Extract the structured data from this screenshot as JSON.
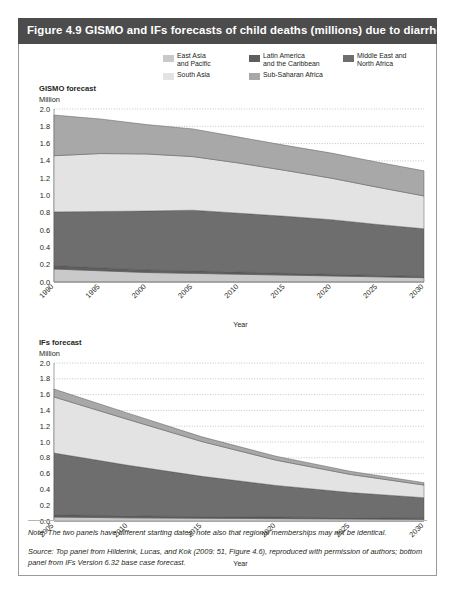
{
  "figure": {
    "title": "Figure 4.9 GISMO and IFs forecasts of child deaths (millions) due to diarrhea",
    "title_bar_color": "#4c4c4c"
  },
  "legend": {
    "items": [
      {
        "label_line1": "East Asia",
        "label_line2": "and Pacific",
        "color": "#c9c9c9",
        "name": "east-asia-and-pacific"
      },
      {
        "label_line1": "Latin America",
        "label_line2": "and the Caribbean",
        "color": "#5e5e5e",
        "name": "latin-america-and-the-caribbean"
      },
      {
        "label_line1": "Middle East and",
        "label_line2": "North Africa",
        "color": "#6e6e6e",
        "name": "middle-east-and-north-africa"
      },
      {
        "label_line1": "South Asia",
        "label_line2": "",
        "color": "#e3e3e3",
        "name": "south-asia"
      },
      {
        "label_line1": "Sub-Saharan Africa",
        "label_line2": "",
        "color": "#a8a8a8",
        "name": "sub-saharan-africa"
      }
    ]
  },
  "panels": {
    "top": {
      "title": "GISMO forecast",
      "unit": "Million",
      "xlabel": "Year"
    },
    "bottom": {
      "title": "IFs forecast",
      "unit": "Million",
      "xlabel": "Year"
    }
  },
  "notes": {
    "note": "Note: The two panels have different starting dates; note also that regional memberships may not be identical.",
    "source": "Source: Top panel from Hilderink, Lucas, and Kok (2009: 51, Figure 4.6), reproduced with permission of authors; bottom panel from IFs Version 6.32 base case forecast."
  },
  "chart_data": [
    {
      "id": "gismo-forecast",
      "type": "area",
      "title": "GISMO forecast",
      "xlabel": "Year",
      "ylabel": "Million",
      "stacked": true,
      "grid": true,
      "legend_position": "top",
      "xlim": [
        1990,
        2030
      ],
      "ylim": [
        0.0,
        2.0
      ],
      "xticks": [
        1990,
        1995,
        2000,
        2005,
        2010,
        2015,
        2020,
        2025,
        2030
      ],
      "xticklabels": [
        "1990",
        "1995",
        "2000",
        "2005",
        "2010",
        "2015",
        "2020",
        "2025",
        "2030"
      ],
      "yticks": [
        0.0,
        0.2,
        0.4,
        0.6,
        0.8,
        1.0,
        1.2,
        1.4,
        1.6,
        1.8,
        2.0
      ],
      "yticklabels": [
        "0.0",
        "0.2",
        "0.4",
        "0.6",
        "0.8",
        "1.0",
        "1.2",
        "1.4",
        "1.6",
        "1.8",
        "2.0"
      ],
      "x": [
        1990,
        1995,
        2000,
        2005,
        2010,
        2015,
        2020,
        2025,
        2030
      ],
      "series": [
        {
          "name": "East Asia and Pacific",
          "color": "#c9c9c9",
          "values": [
            0.15,
            0.13,
            0.11,
            0.1,
            0.09,
            0.08,
            0.07,
            0.06,
            0.05
          ]
        },
        {
          "name": "Latin America and the Caribbean",
          "color": "#5e5e5e",
          "values": [
            0.04,
            0.035,
            0.03,
            0.03,
            0.025,
            0.02,
            0.02,
            0.015,
            0.015
          ]
        },
        {
          "name": "Middle East and North Africa",
          "color": "#6e6e6e",
          "values": [
            0.62,
            0.65,
            0.68,
            0.7,
            0.68,
            0.66,
            0.63,
            0.59,
            0.55
          ]
        },
        {
          "name": "South Asia",
          "color": "#e3e3e3",
          "values": [
            0.65,
            0.67,
            0.66,
            0.62,
            0.58,
            0.53,
            0.48,
            0.43,
            0.38
          ]
        },
        {
          "name": "Sub-Saharan Africa",
          "color": "#a8a8a8",
          "values": [
            0.47,
            0.4,
            0.34,
            0.32,
            0.3,
            0.29,
            0.29,
            0.29,
            0.29
          ]
        }
      ],
      "totals": [
        1.93,
        1.885,
        1.82,
        1.77,
        1.675,
        1.58,
        1.49,
        1.385,
        1.285
      ]
    },
    {
      "id": "ifs-forecast",
      "type": "area",
      "title": "IFs forecast",
      "xlabel": "Year",
      "ylabel": "Million",
      "stacked": true,
      "grid": true,
      "legend_position": "top",
      "xlim": [
        2005,
        2030
      ],
      "ylim": [
        0.0,
        2.0
      ],
      "xticks": [
        2005,
        2010,
        2015,
        2020,
        2025,
        2030
      ],
      "xticklabels": [
        "2005",
        "2010",
        "2015",
        "2020",
        "2025",
        "2030"
      ],
      "yticks": [
        0.0,
        0.2,
        0.4,
        0.6,
        0.8,
        1.0,
        1.2,
        1.4,
        1.6,
        1.8,
        2.0
      ],
      "yticklabels": [
        "0.0",
        "0.2",
        "0.4",
        "0.6",
        "0.8",
        "1.0",
        "1.2",
        "1.4",
        "1.6",
        "1.8",
        "2.0"
      ],
      "x": [
        2005,
        2010,
        2015,
        2020,
        2025,
        2030
      ],
      "series": [
        {
          "name": "East Asia and Pacific",
          "color": "#c9c9c9",
          "values": [
            0.05,
            0.04,
            0.035,
            0.03,
            0.025,
            0.02
          ]
        },
        {
          "name": "Latin America and the Caribbean",
          "color": "#5e5e5e",
          "values": [
            0.03,
            0.025,
            0.02,
            0.02,
            0.015,
            0.015
          ]
        },
        {
          "name": "Middle East and North Africa",
          "color": "#6e6e6e",
          "values": [
            0.78,
            0.64,
            0.51,
            0.4,
            0.32,
            0.26
          ]
        },
        {
          "name": "South Asia",
          "color": "#e3e3e3",
          "values": [
            0.71,
            0.58,
            0.44,
            0.32,
            0.23,
            0.16
          ]
        },
        {
          "name": "Sub-Saharan Africa",
          "color": "#a8a8a8",
          "values": [
            0.1,
            0.08,
            0.06,
            0.05,
            0.04,
            0.03
          ]
        }
      ],
      "totals": [
        1.67,
        1.365,
        1.065,
        0.82,
        0.63,
        0.485
      ]
    }
  ]
}
